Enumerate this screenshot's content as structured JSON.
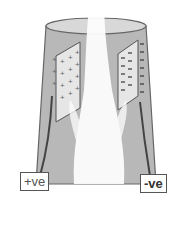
{
  "diagram": {
    "title": "",
    "labels": {
      "positive": "+ve",
      "negative": "-ve"
    },
    "elements": [
      {
        "name": "chimney",
        "description": "grey cylindrical stack"
      },
      {
        "name": "positive-plate",
        "symbol": "+"
      },
      {
        "name": "negative-plate",
        "symbol": "-"
      },
      {
        "name": "smoke-plume"
      }
    ],
    "colors": {
      "chimney": "#b8b8b8",
      "chimney_top": "#d8d8d8",
      "outline": "#555555",
      "smoke": "#ffffff"
    }
  }
}
